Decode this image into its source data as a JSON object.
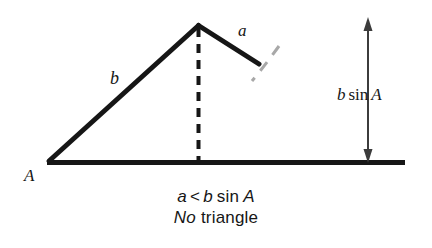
{
  "figure": {
    "name": "ambiguous-case-no-triangle-diagram",
    "ink_color": "#161616",
    "arc_color": "#9a9a9a",
    "background": "#ffffff",
    "width": 432,
    "height": 248
  },
  "labels": {
    "side_b": "b",
    "side_a": "a",
    "angle_A": "A",
    "height_b": "b",
    "height_sin": "sin",
    "height_A": "A",
    "height_full": "b sin A"
  },
  "caption": {
    "line1": {
      "a": "a",
      "operator": "<",
      "b": "b",
      "sin": "sin",
      "A": "A",
      "full": "a < b sin A"
    },
    "line2": {
      "no": "No",
      "triangle": "triangle",
      "full": "No triangle"
    }
  },
  "geometry": {
    "vertex_A": [
      48,
      162
    ],
    "apex": [
      198,
      25
    ],
    "a_end": [
      260,
      64
    ],
    "base_end": [
      405,
      162
    ],
    "altitude_foot": [
      198,
      162
    ],
    "arrow_x": 368,
    "arrow_top": 20,
    "arrow_bottom": 161
  }
}
